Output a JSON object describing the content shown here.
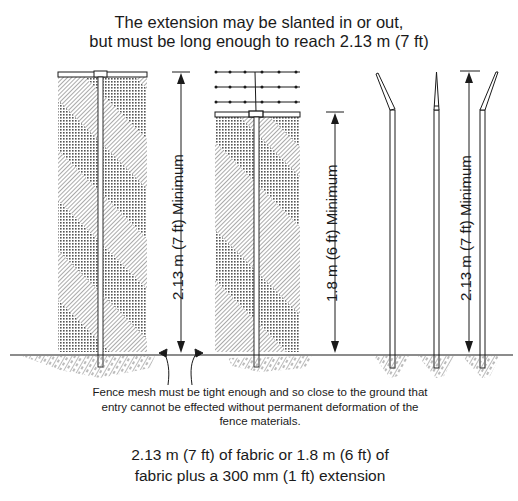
{
  "header": {
    "line1": "The extension may be slanted in or out,",
    "line2": "but must be long enough to reach 2.13 m (7 ft)"
  },
  "figures": [
    {
      "name": "full-height-fabric-fence",
      "dimension_label": "2.13 m (7 ft) Minimum"
    },
    {
      "name": "fabric-plus-barbed-wire-extension",
      "dimension_label": "1.8 m (6 ft) Minimum",
      "barbed_wire_strands": 3
    },
    {
      "name": "slanted-post-extensions",
      "dimension_label": "2.13 m (7 ft) Minimum",
      "posts": [
        "slanted-out",
        "straight",
        "slanted-in"
      ]
    }
  ],
  "notes": {
    "ground_clearance": "Fence mesh must be tight enough and so close to the ground that entry cannot be effected without permanent deformation of the fence materials."
  },
  "caption": {
    "line1": "2.13 m (7 ft) of fabric or 1.8 m (6 ft) of",
    "line2": "fabric plus a 300 mm (1 ft) extension"
  },
  "colors": {
    "ink": "#1a1a1a",
    "hatch": "#6a6a6a",
    "background": "#ffffff"
  }
}
